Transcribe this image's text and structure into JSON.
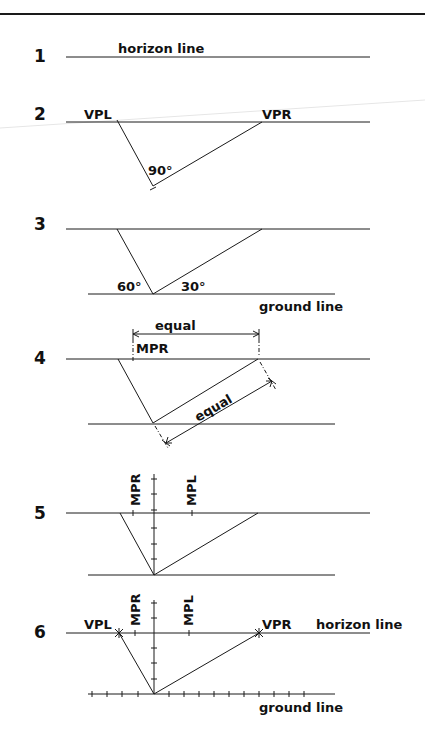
{
  "diagram": {
    "colors": {
      "ink": "#1a1a1a",
      "background": "#ffffff"
    },
    "steps": [
      {
        "number": "1",
        "labels": {
          "horizon": "horizon line"
        }
      },
      {
        "number": "2",
        "labels": {
          "vpl": "VPL",
          "vpr": "VPR",
          "angle": "90°"
        }
      },
      {
        "number": "3",
        "labels": {
          "angle_left": "60°",
          "angle_right": "30°",
          "ground": "ground line"
        }
      },
      {
        "number": "4",
        "labels": {
          "equal_top": "equal",
          "mpr": "MPR",
          "equal_diag": "equal"
        }
      },
      {
        "number": "5",
        "labels": {
          "mpr": "MPR",
          "mpl": "MPL"
        }
      },
      {
        "number": "6",
        "labels": {
          "vpl": "VPL",
          "mpr": "MPR",
          "mpl": "MPL",
          "vpr": "VPR",
          "horizon": "horizon line",
          "ground": "ground line"
        }
      }
    ]
  }
}
